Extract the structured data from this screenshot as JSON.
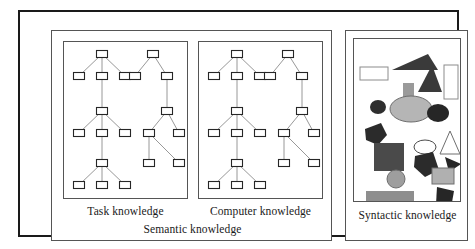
{
  "figure": {
    "background": "#ffffff",
    "outline_color": "#1a1a1a",
    "panel_outline_color": "#555555"
  },
  "labels": {
    "task": "Task knowledge",
    "computer": "Computer knowledge",
    "semantic": "Semantic knowledge",
    "syntactic": "Syntactic knowledge"
  },
  "node_style": {
    "width": 11,
    "height": 7,
    "stroke": "#262626",
    "fill": "#ffffff",
    "stroke_width": 1.1,
    "link_stroke": "#8c8c8c",
    "link_width": 0.9
  },
  "trees": {
    "type_a": {
      "description": "three-level chain, each level a root with three children",
      "nodes": [
        {
          "id": "a1",
          "x": 38,
          "y": 12
        },
        {
          "id": "a2",
          "x": 15,
          "y": 34
        },
        {
          "id": "a3",
          "x": 38,
          "y": 34
        },
        {
          "id": "a4",
          "x": 61,
          "y": 34
        },
        {
          "id": "a5",
          "x": 38,
          "y": 69
        },
        {
          "id": "a6",
          "x": 15,
          "y": 91
        },
        {
          "id": "a7",
          "x": 38,
          "y": 91
        },
        {
          "id": "a8",
          "x": 61,
          "y": 91
        },
        {
          "id": "a9",
          "x": 38,
          "y": 121
        },
        {
          "id": "a10",
          "x": 15,
          "y": 143
        },
        {
          "id": "a11",
          "x": 38,
          "y": 143
        },
        {
          "id": "a12",
          "x": 61,
          "y": 143
        }
      ],
      "links": [
        [
          "a1",
          "a2"
        ],
        [
          "a1",
          "a3"
        ],
        [
          "a1",
          "a4"
        ],
        [
          "a3",
          "a5"
        ],
        [
          "a5",
          "a6"
        ],
        [
          "a5",
          "a7"
        ],
        [
          "a5",
          "a8"
        ],
        [
          "a7",
          "a9"
        ],
        [
          "a9",
          "a10"
        ],
        [
          "a9",
          "a11"
        ],
        [
          "a9",
          "a12"
        ]
      ]
    },
    "type_b": {
      "description": "asymmetric chain, roots with two children each",
      "nodes": [
        {
          "id": "b1",
          "x": 30,
          "y": 12
        },
        {
          "id": "b2",
          "x": 12,
          "y": 34
        },
        {
          "id": "b3",
          "x": 44,
          "y": 34
        },
        {
          "id": "b4",
          "x": 44,
          "y": 69
        },
        {
          "id": "b5",
          "x": 26,
          "y": 91
        },
        {
          "id": "b6",
          "x": 56,
          "y": 91
        },
        {
          "id": "b7",
          "x": 26,
          "y": 121
        },
        {
          "id": "b8",
          "x": 56,
          "y": 121
        }
      ],
      "links": [
        [
          "b1",
          "b2"
        ],
        [
          "b1",
          "b3"
        ],
        [
          "b3",
          "b4"
        ],
        [
          "b4",
          "b5"
        ],
        [
          "b4",
          "b6"
        ],
        [
          "b5",
          "b7"
        ],
        [
          "b5",
          "b8"
        ]
      ]
    }
  },
  "shapes_panel": {
    "description": "assorted abstract geometric shapes representing syntactic knowledge",
    "shapes": [
      {
        "name": "outlined-rectangle-small",
        "type": "rect",
        "x": 6,
        "y": 28,
        "w": 28,
        "h": 13,
        "fill": "#ffffff",
        "stroke": "#8c8c8c"
      },
      {
        "name": "dark-triangle-wide",
        "type": "polygon",
        "points": "38,31 74,15 84,31",
        "fill": "#3a3a3a",
        "stroke": "none"
      },
      {
        "name": "dark-triangle-right",
        "type": "polygon",
        "points": "64,53 78,26 88,53",
        "fill": "#3a3a3a",
        "stroke": "none"
      },
      {
        "name": "outlined-rectangle-tall",
        "type": "rect",
        "x": 90,
        "y": 26,
        "w": 14,
        "h": 34,
        "fill": "#ffffff",
        "stroke": "#8c8c8c"
      },
      {
        "name": "gray-rectangle-vertical",
        "type": "rect",
        "x": 49,
        "y": 44,
        "w": 11,
        "h": 26,
        "fill": "#9a9a9a",
        "stroke": "none"
      },
      {
        "name": "light-gray-ellipse-large",
        "type": "ellipse",
        "cx": 57,
        "cy": 70,
        "rx": 21,
        "ry": 13,
        "fill": "#b5b5b5",
        "stroke": "#6e6e6e"
      },
      {
        "name": "dark-ellipse-small-left",
        "type": "ellipse",
        "cx": 24,
        "cy": 68,
        "rx": 8,
        "ry": 7,
        "fill": "#2e2e2e",
        "stroke": "none"
      },
      {
        "name": "dark-ellipse-right",
        "type": "ellipse",
        "cx": 84,
        "cy": 74,
        "rx": 11,
        "ry": 9,
        "fill": "#262626",
        "stroke": "none"
      },
      {
        "name": "dark-pentagon-left",
        "type": "polygon",
        "points": "11,90 27,84 33,96 24,106 12,101",
        "fill": "#2b2b2b",
        "stroke": "none"
      },
      {
        "name": "dark-gray-square",
        "type": "rect",
        "x": 20,
        "y": 104,
        "w": 30,
        "h": 28,
        "fill": "#4a4a4a",
        "stroke": "none"
      },
      {
        "name": "outlined-ellipse-white",
        "type": "ellipse",
        "cx": 71,
        "cy": 108,
        "rx": 11,
        "ry": 7,
        "fill": "#ffffff",
        "stroke": "#4a4a4a"
      },
      {
        "name": "outlined-triangle-white",
        "type": "polygon",
        "points": "96,92 106,115 86,115",
        "fill": "#ffffff",
        "stroke": "#6e6e6e"
      },
      {
        "name": "dark-pentagon-middle",
        "type": "polygon",
        "points": "61,117 79,113 85,131 71,138 60,128",
        "fill": "#2b2b2b",
        "stroke": "none"
      },
      {
        "name": "dark-triangle-small-right",
        "type": "polygon",
        "points": "91,118 107,125 95,133",
        "fill": "#262626",
        "stroke": "none"
      },
      {
        "name": "gray-circle",
        "type": "ellipse",
        "cx": 42,
        "cy": 140,
        "rx": 9,
        "ry": 9,
        "fill": "#9e9e9e",
        "stroke": "#6e6e6e"
      },
      {
        "name": "light-gray-rectangle",
        "type": "rect",
        "x": 78,
        "y": 129,
        "w": 22,
        "h": 16,
        "fill": "#b0b0b0",
        "stroke": "#6e6e6e"
      },
      {
        "name": "gray-rectangle-large-bottom",
        "type": "rect",
        "x": 12,
        "y": 152,
        "w": 48,
        "h": 21,
        "fill": "#8e8e8e",
        "stroke": "none"
      },
      {
        "name": "dark-quadrilateral-bottom",
        "type": "polygon",
        "points": "83,148 100,152 97,169 82,165",
        "fill": "#262626",
        "stroke": "none"
      }
    ]
  }
}
